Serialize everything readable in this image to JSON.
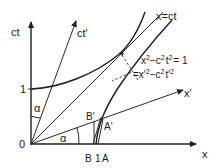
{
  "diagram": {
    "axes": {
      "vertical_label": "ct",
      "horizontal_label": "x",
      "primed_time_label": "ct'",
      "primed_space_label": "x'",
      "origin_label": "0",
      "unit_tick_ct": "1",
      "unit_tick_x": "1"
    },
    "lines": {
      "light_line_label": "x=ct"
    },
    "equations": {
      "hyperbola": "x² − c² t² = 1",
      "invariant": "= x′² − c² t′²",
      "hyperbola_parts": {
        "x": "x",
        "x_exp": "2",
        "mid": "−c",
        "c_exp": "2",
        "t": "t",
        "t_exp": "2",
        "rhs": "= 1"
      },
      "invariant_parts": {
        "eq": "=x′",
        "x_exp": "2",
        "mid": "−c",
        "c_exp": "2",
        "t": "t′",
        "t_exp": "2"
      }
    },
    "points": {
      "A": "A",
      "A_prime": "A'",
      "B": "B",
      "B_prime": "B'"
    },
    "angles": {
      "alpha_time": "α",
      "alpha_space": "α"
    },
    "colors": {
      "ink": "#1e1e1e",
      "background": "#ffffff"
    }
  }
}
